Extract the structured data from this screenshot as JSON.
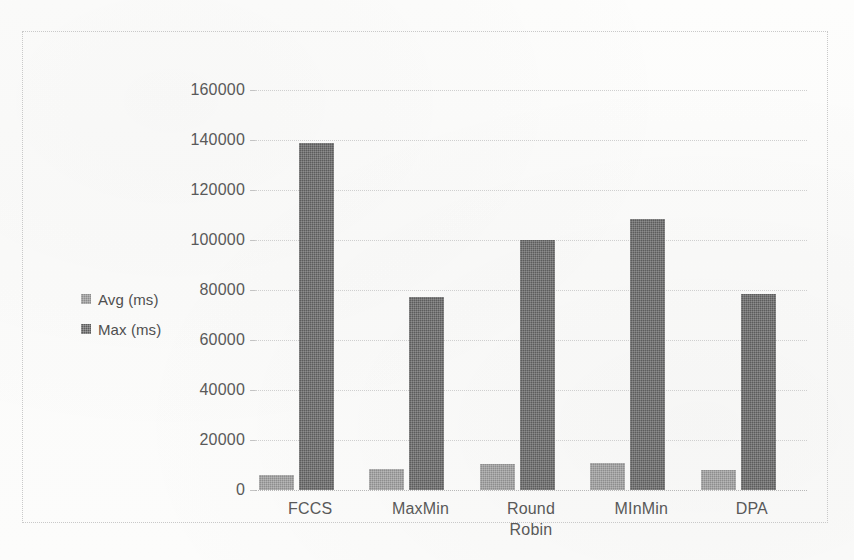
{
  "chart_data": {
    "type": "bar",
    "title": "",
    "subtitle": "",
    "xlabel": "",
    "ylabel": "",
    "categories": [
      "FCCS",
      "MaxMin",
      "Round Robin",
      "MInMin",
      "DPA"
    ],
    "category_lines": [
      [
        "FCCS"
      ],
      [
        "MaxMin"
      ],
      [
        "Round",
        "Robin"
      ],
      [
        "MInMin"
      ],
      [
        "DPA"
      ]
    ],
    "series": [
      {
        "name": "Avg (ms)",
        "color": "#8d8d8d",
        "values": [
          6000,
          8400,
          10400,
          10800,
          8200
        ]
      },
      {
        "name": "Max (ms)",
        "color": "#5c5c5c",
        "values": [
          139000,
          77200,
          100000,
          108400,
          78400
        ]
      }
    ],
    "ylim": [
      0,
      160000
    ],
    "ytick_step": 20000,
    "yticks": [
      160000,
      140000,
      120000,
      100000,
      80000,
      60000,
      40000,
      20000,
      0
    ],
    "ytick_labels": [
      "160000",
      "140000",
      "120000",
      "100000",
      "80000",
      "60000",
      "40000",
      "20000",
      "0"
    ],
    "grid": true,
    "grid_axis": "y",
    "legend_position": "left",
    "plot_background": "#ffffff",
    "grid_color": "#cfcfcf",
    "axis_text_color": "#595959",
    "frame_border_color": "#c9c9c9"
  },
  "legend": {
    "items": [
      {
        "label": "Avg (ms)",
        "color": "#8d8d8d"
      },
      {
        "label": "Max (ms)",
        "color": "#5c5c5c"
      }
    ]
  }
}
